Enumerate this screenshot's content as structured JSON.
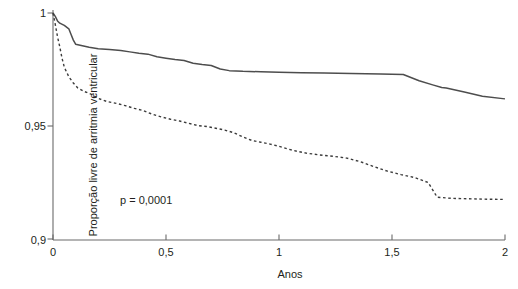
{
  "chart_data": {
    "type": "line",
    "title": "",
    "subtitle": "",
    "xlabel": "Anos",
    "ylabel": "Proporção livre de arritmia ventricular",
    "xlim": [
      0,
      2
    ],
    "ylim": [
      0.9,
      1
    ],
    "grid": false,
    "legend_position": "none",
    "x_ticks": [
      0,
      0.5,
      1,
      1.5,
      2
    ],
    "x_tick_labels": [
      "0",
      "0,5",
      "1",
      "1,5",
      "2"
    ],
    "y_ticks": [
      0.9,
      0.95,
      1
    ],
    "y_tick_labels": [
      "0,9",
      "0,95",
      "1"
    ],
    "annotations": [
      {
        "text": "p = 0,0001",
        "x": 0.3,
        "y": 0.918
      }
    ],
    "series": [
      {
        "name": "solid-curve",
        "style": "solid",
        "color": "#4d4d4d",
        "points": [
          [
            0.0,
            1.0
          ],
          [
            0.01,
            0.9985
          ],
          [
            0.02,
            0.9965
          ],
          [
            0.03,
            0.9955
          ],
          [
            0.05,
            0.9945
          ],
          [
            0.07,
            0.993
          ],
          [
            0.08,
            0.9905
          ],
          [
            0.09,
            0.988
          ],
          [
            0.1,
            0.9862
          ],
          [
            0.13,
            0.9855
          ],
          [
            0.16,
            0.9848
          ],
          [
            0.2,
            0.9842
          ],
          [
            0.25,
            0.9838
          ],
          [
            0.3,
            0.9834
          ],
          [
            0.34,
            0.9828
          ],
          [
            0.38,
            0.9822
          ],
          [
            0.42,
            0.9818
          ],
          [
            0.46,
            0.9806
          ],
          [
            0.5,
            0.98
          ],
          [
            0.54,
            0.9794
          ],
          [
            0.58,
            0.979
          ],
          [
            0.62,
            0.9778
          ],
          [
            0.66,
            0.9772
          ],
          [
            0.7,
            0.9768
          ],
          [
            0.74,
            0.9752
          ],
          [
            0.78,
            0.9745
          ],
          [
            0.84,
            0.9742
          ],
          [
            0.92,
            0.974
          ],
          [
            1.0,
            0.9738
          ],
          [
            1.1,
            0.9736
          ],
          [
            1.2,
            0.9734
          ],
          [
            1.32,
            0.9732
          ],
          [
            1.45,
            0.973
          ],
          [
            1.55,
            0.9728
          ],
          [
            1.62,
            0.97
          ],
          [
            1.68,
            0.9682
          ],
          [
            1.72,
            0.967
          ],
          [
            1.74,
            0.9668
          ],
          [
            1.82,
            0.965
          ],
          [
            1.9,
            0.9632
          ],
          [
            2.0,
            0.962
          ]
        ]
      },
      {
        "name": "dashed-curve",
        "style": "dashed",
        "color": "#3b3b3b",
        "points": [
          [
            0.0,
            1.0
          ],
          [
            0.01,
            0.995
          ],
          [
            0.02,
            0.9895
          ],
          [
            0.03,
            0.985
          ],
          [
            0.04,
            0.98
          ],
          [
            0.05,
            0.976
          ],
          [
            0.07,
            0.9718
          ],
          [
            0.09,
            0.969
          ],
          [
            0.11,
            0.9668
          ],
          [
            0.14,
            0.9652
          ],
          [
            0.17,
            0.964
          ],
          [
            0.2,
            0.9622
          ],
          [
            0.24,
            0.9608
          ],
          [
            0.28,
            0.96
          ],
          [
            0.32,
            0.959
          ],
          [
            0.36,
            0.9578
          ],
          [
            0.4,
            0.9568
          ],
          [
            0.44,
            0.9552
          ],
          [
            0.48,
            0.954
          ],
          [
            0.52,
            0.953
          ],
          [
            0.56,
            0.9522
          ],
          [
            0.6,
            0.9512
          ],
          [
            0.64,
            0.9502
          ],
          [
            0.68,
            0.9498
          ],
          [
            0.72,
            0.949
          ],
          [
            0.76,
            0.9482
          ],
          [
            0.8,
            0.947
          ],
          [
            0.84,
            0.9452
          ],
          [
            0.88,
            0.9436
          ],
          [
            0.92,
            0.9428
          ],
          [
            0.96,
            0.942
          ],
          [
            1.0,
            0.941
          ],
          [
            1.04,
            0.9398
          ],
          [
            1.08,
            0.9388
          ],
          [
            1.12,
            0.938
          ],
          [
            1.18,
            0.9372
          ],
          [
            1.24,
            0.9366
          ],
          [
            1.3,
            0.9358
          ],
          [
            1.36,
            0.9342
          ],
          [
            1.42,
            0.932
          ],
          [
            1.48,
            0.93
          ],
          [
            1.54,
            0.9285
          ],
          [
            1.6,
            0.9272
          ],
          [
            1.66,
            0.925
          ],
          [
            1.7,
            0.9185
          ],
          [
            1.76,
            0.918
          ],
          [
            1.84,
            0.9178
          ],
          [
            1.92,
            0.9176
          ],
          [
            2.0,
            0.9175
          ]
        ]
      }
    ]
  },
  "axes": {
    "x_title": "Anos",
    "y_title": "Proporção livre de arritmia ventricular",
    "x_tick_labels": [
      "0",
      "0,5",
      "1",
      "1,5",
      "2"
    ],
    "y_tick_labels": [
      "1",
      "0,95",
      "0,9"
    ]
  },
  "annotation": {
    "pvalue": "p = 0,0001"
  },
  "colors": {
    "axis": "#6b6b6b",
    "solid_curve": "#4d4d4d",
    "dashed_curve": "#3b3b3b",
    "text": "#231f20",
    "background": "#ffffff"
  }
}
